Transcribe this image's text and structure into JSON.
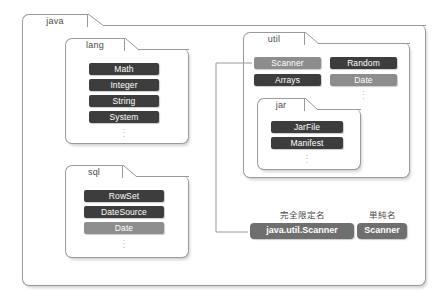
{
  "diagram": {
    "title_hidden": "",
    "root_package": {
      "name": "java",
      "subpackages": [
        {
          "name": "lang",
          "classes": [
            {
              "label": "Math",
              "style": "dark"
            },
            {
              "label": "Integer",
              "style": "dark"
            },
            {
              "label": "String",
              "style": "dark"
            },
            {
              "label": "System",
              "style": "dark"
            }
          ],
          "more": "⋮"
        },
        {
          "name": "sql",
          "classes": [
            {
              "label": "RowSet",
              "style": "dark"
            },
            {
              "label": "DateSource",
              "style": "dark"
            },
            {
              "label": "Date",
              "style": "light"
            }
          ],
          "more": "⋮"
        },
        {
          "name": "util",
          "classes_left": [
            {
              "label": "Scanner",
              "style": "light"
            },
            {
              "label": "Arrays",
              "style": "dark"
            }
          ],
          "classes_right": [
            {
              "label": "Random",
              "style": "dark"
            },
            {
              "label": "Date",
              "style": "light"
            }
          ],
          "more": "⋮",
          "subpackages": [
            {
              "name": "jar",
              "classes": [
                {
                  "label": "JarFile",
                  "style": "dark"
                },
                {
                  "label": "Manifest",
                  "style": "dark"
                }
              ],
              "more": "⋮"
            }
          ]
        }
      ]
    },
    "callout": {
      "fqn_label": "完全限定名",
      "fqn_value": "java.util.Scanner",
      "simple_label": "単純名",
      "simple_value": "Scanner"
    },
    "colors": {
      "pill_dark": "#3d3d3d",
      "pill_light": "#8d8d8d",
      "callout_pill": "#6f6f6f",
      "folder_border": "#9a9a9a",
      "background": "#ffffff",
      "text": "#4a4a4a"
    }
  }
}
